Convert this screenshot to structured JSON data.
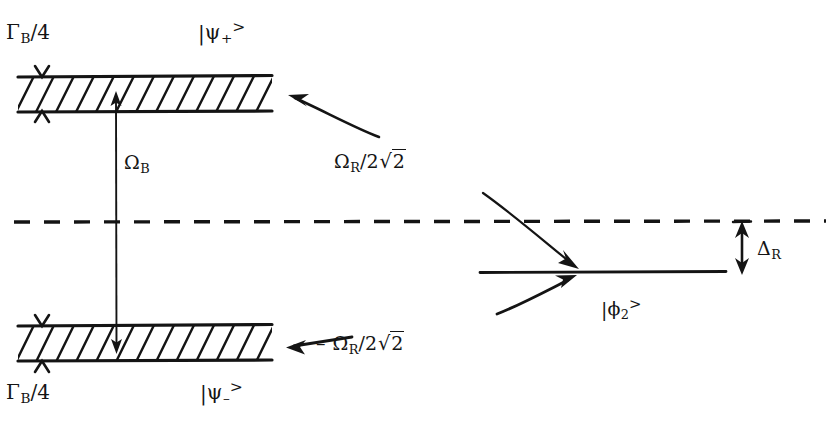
{
  "figure": {
    "type": "energy-level-diagram",
    "background_color": "#ffffff",
    "ink_color": "#141414"
  },
  "labels": {
    "gamma_top": {
      "symbol": "Γ",
      "sub": "B",
      "rest": "/4",
      "text": "ΓB/4"
    },
    "gamma_bottom": {
      "symbol": "Γ",
      "sub": "B",
      "rest": "/4",
      "text": "ΓB/4"
    },
    "ket_psi_plus": {
      "bar": "|",
      "symbol": "ψ",
      "sub": "+",
      "sup": ">",
      "text": "|ψ+>"
    },
    "ket_psi_minus": {
      "bar": "|",
      "symbol": "ψ",
      "sub": "–",
      "sup": ">",
      "text": "|ψ–>"
    },
    "ket_phi_2": {
      "bar": "|",
      "symbol": "ϕ",
      "sub": "2",
      "sup": ">",
      "text": "|ϕ2>"
    },
    "omega_b": {
      "symbol": "Ω",
      "sub": "B",
      "text": "ΩB"
    },
    "omega_r_plus": {
      "symbol": "Ω",
      "sub": "R",
      "rest": "/2",
      "radicand": "2",
      "text": "ΩR/2√2"
    },
    "omega_r_minus": {
      "sign": "–",
      "symbol": "Ω",
      "sub": "R",
      "rest": "/2",
      "radicand": "2",
      "text": "– ΩR/2√2"
    },
    "delta_r": {
      "symbol": "Δ",
      "sub": "R",
      "text": "ΔR"
    }
  },
  "levels": [
    {
      "name": "psi-plus-band",
      "style": "hatched-band",
      "ket": "|ψ+>",
      "width_label": "ΓB/4",
      "shift_label": "ΩR/2√2",
      "x1": 18,
      "x2": 272,
      "y_top": 76,
      "y_bottom": 112
    },
    {
      "name": "psi-minus-band",
      "style": "hatched-band",
      "ket": "|ψ–>",
      "width_label": "ΓB/4",
      "shift_label": "– ΩR/2√2",
      "x1": 18,
      "x2": 272,
      "y_top": 325,
      "y_bottom": 362
    },
    {
      "name": "phi-2-level",
      "style": "solid-line",
      "ket": "|ϕ2>",
      "x1": 480,
      "x2": 726,
      "y": 272
    },
    {
      "name": "reference-dashed-line",
      "style": "dashed-line",
      "x1": 14,
      "x2": 826,
      "y": 222
    }
  ],
  "arrows": [
    {
      "name": "omega-b-transition",
      "kind": "double-headed-vertical",
      "label": "ΩB",
      "x": 116,
      "y_top": 93,
      "y_bottom": 352
    },
    {
      "name": "delta-r-detuning",
      "kind": "double-headed-vertical",
      "label": "ΔR",
      "x": 742,
      "y_top": 224,
      "y_bottom": 272
    },
    {
      "name": "omega-r-plus-pointer",
      "kind": "curved-arrow",
      "label": "ΩR/2√2",
      "from_x": 378,
      "from_y": 136,
      "to_x": 290,
      "to_y": 96
    },
    {
      "name": "omega-r-minus-pointer",
      "kind": "straight-arrow",
      "label": "– ΩR/2√2",
      "from_x": 350,
      "from_y": 338,
      "to_x": 288,
      "to_y": 347
    },
    {
      "name": "phi2-pointer-upper",
      "kind": "curved-arrow",
      "from_x": 483,
      "from_y": 193,
      "to_x": 580,
      "to_y": 268
    },
    {
      "name": "phi2-pointer-lower",
      "kind": "straight-arrow",
      "from_x": 497,
      "from_y": 313,
      "to_x": 578,
      "to_y": 276
    }
  ],
  "band_width_markers": [
    {
      "name": "psi-plus-width-marker",
      "x": 42,
      "y_top": 68,
      "y_bottom": 122
    },
    {
      "name": "psi-minus-width-marker",
      "x": 42,
      "y_top": 316,
      "y_bottom": 372
    }
  ]
}
